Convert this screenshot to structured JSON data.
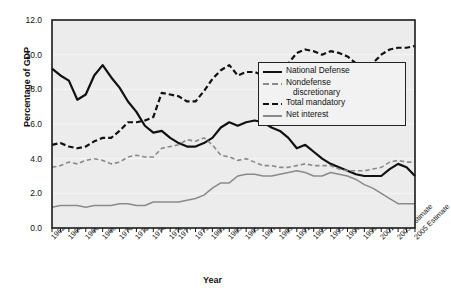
{
  "chart_data": {
    "type": "line",
    "title": "",
    "xlabel": "Year",
    "ylabel": "Percentage of GDP",
    "ylim": [
      0.0,
      12.0
    ],
    "yticks": [
      "0.0",
      "2.0",
      "4.0",
      "6.0",
      "8.0",
      "10.0",
      "12.0"
    ],
    "ytick_values": [
      0.0,
      2.0,
      4.0,
      6.0,
      8.0,
      10.0,
      12.0
    ],
    "grid": "horizontal",
    "legend_position": "right-upper-inside",
    "xlim": [
      1962,
      2005
    ],
    "x": [
      1962,
      1963,
      1964,
      1965,
      1966,
      1967,
      1968,
      1969,
      1970,
      1971,
      1972,
      1973,
      1974,
      1975,
      1976,
      1977,
      1978,
      1979,
      1980,
      1981,
      1982,
      1983,
      1984,
      1985,
      1986,
      1987,
      1988,
      1989,
      1990,
      1991,
      1992,
      1993,
      1994,
      1995,
      1996,
      1997,
      1998,
      1999,
      2000,
      2001,
      2002,
      2003,
      2004,
      2005
    ],
    "xtick_labels": [
      "1962",
      "1964",
      "1966",
      "1968",
      "1970",
      "1972",
      "1974",
      "1976",
      "1977",
      "1979",
      "1981",
      "1983",
      "1985",
      "1987",
      "1989",
      "1991",
      "1993",
      "1995",
      "1997",
      "1999",
      "2001 Estimate",
      "2003 Estimate",
      "2005 Estimate"
    ],
    "xtick_label_years": [
      1962,
      1964,
      1966,
      1968,
      1970,
      1972,
      1974,
      1976,
      1977,
      1979,
      1981,
      1983,
      1985,
      1987,
      1989,
      1991,
      1993,
      1995,
      1997,
      1999,
      2001,
      2003,
      2005
    ],
    "series": [
      {
        "name": "National Defense",
        "style": "solid",
        "color": "#111111",
        "width": 2.2,
        "values": [
          9.2,
          8.8,
          8.5,
          7.4,
          7.7,
          8.8,
          9.4,
          8.7,
          8.1,
          7.3,
          6.7,
          5.9,
          5.5,
          5.6,
          5.2,
          4.9,
          4.7,
          4.7,
          4.9,
          5.2,
          5.8,
          6.1,
          5.9,
          6.1,
          6.2,
          6.1,
          5.8,
          5.6,
          5.2,
          4.6,
          4.8,
          4.4,
          4.0,
          3.7,
          3.5,
          3.3,
          3.1,
          3.0,
          3.0,
          3.0,
          3.4,
          3.7,
          3.5,
          3.0
        ]
      },
      {
        "name": "Nondefense discretionary",
        "style": "dashed",
        "color": "#8a8a8a",
        "width": 1.6,
        "values": [
          3.5,
          3.6,
          3.8,
          3.7,
          3.9,
          4.0,
          3.9,
          3.7,
          3.8,
          4.1,
          4.2,
          4.1,
          4.1,
          4.6,
          4.7,
          4.8,
          5.1,
          5.0,
          5.2,
          4.8,
          4.2,
          4.1,
          3.9,
          4.0,
          3.8,
          3.6,
          3.6,
          3.5,
          3.5,
          3.6,
          3.7,
          3.6,
          3.6,
          3.6,
          3.4,
          3.3,
          3.3,
          3.3,
          3.4,
          3.5,
          3.8,
          3.9,
          3.8,
          3.8
        ]
      },
      {
        "name": "Total mandatory",
        "style": "dashed",
        "color": "#111111",
        "width": 2.2,
        "values": [
          4.8,
          4.9,
          4.7,
          4.6,
          4.7,
          5.0,
          5.2,
          5.2,
          5.6,
          6.1,
          6.1,
          6.2,
          6.4,
          7.8,
          7.7,
          7.6,
          7.3,
          7.3,
          7.9,
          8.6,
          9.1,
          9.4,
          8.8,
          9.0,
          9.0,
          8.8,
          8.9,
          9.0,
          9.5,
          10.1,
          10.3,
          10.2,
          10.0,
          10.2,
          10.1,
          9.9,
          9.5,
          9.4,
          9.5,
          10.0,
          10.3,
          10.4,
          10.4,
          10.5
        ]
      },
      {
        "name": "Net interest",
        "style": "solid",
        "color": "#8a8a8a",
        "width": 1.5,
        "values": [
          1.2,
          1.3,
          1.3,
          1.3,
          1.2,
          1.3,
          1.3,
          1.3,
          1.4,
          1.4,
          1.3,
          1.3,
          1.5,
          1.5,
          1.5,
          1.5,
          1.6,
          1.7,
          1.9,
          2.3,
          2.6,
          2.6,
          3.0,
          3.1,
          3.1,
          3.0,
          3.0,
          3.1,
          3.2,
          3.3,
          3.2,
          3.0,
          3.0,
          3.2,
          3.1,
          3.0,
          2.8,
          2.5,
          2.3,
          2.0,
          1.7,
          1.4,
          1.4,
          1.4
        ]
      }
    ]
  },
  "legend": {
    "items": [
      {
        "label": "National Defense",
        "label2": ""
      },
      {
        "label": "Nondefense",
        "label2": "discretionary"
      },
      {
        "label": "Total mandatory",
        "label2": ""
      },
      {
        "label": "Net interest",
        "label2": ""
      }
    ]
  },
  "colors": {
    "plot_background": "#ececec",
    "gridline": "#f7f7f7",
    "axis": "#1a1a1a",
    "series_dark": "#111111",
    "series_gray": "#8a8a8a",
    "legend_background": "#f2f2f2"
  }
}
